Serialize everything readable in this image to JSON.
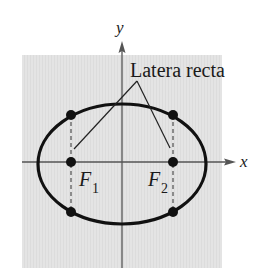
{
  "figure": {
    "type": "ellipse-latera-recta",
    "background_panel_color": "#e6e6e6",
    "axis_color": "#555555",
    "curve_color": "#111111",
    "axes": {
      "x_label": "x",
      "y_label": "y"
    },
    "annotation": {
      "text": "Latera recta"
    },
    "foci": [
      {
        "label": "F",
        "subscript": "1"
      },
      {
        "label": "F",
        "subscript": "2"
      }
    ],
    "points": [
      {
        "name": "focus-1"
      },
      {
        "name": "focus-2"
      },
      {
        "name": "latus-rectum-1-top"
      },
      {
        "name": "latus-rectum-1-bottom"
      },
      {
        "name": "latus-rectum-2-top"
      },
      {
        "name": "latus-rectum-2-bottom"
      }
    ]
  }
}
